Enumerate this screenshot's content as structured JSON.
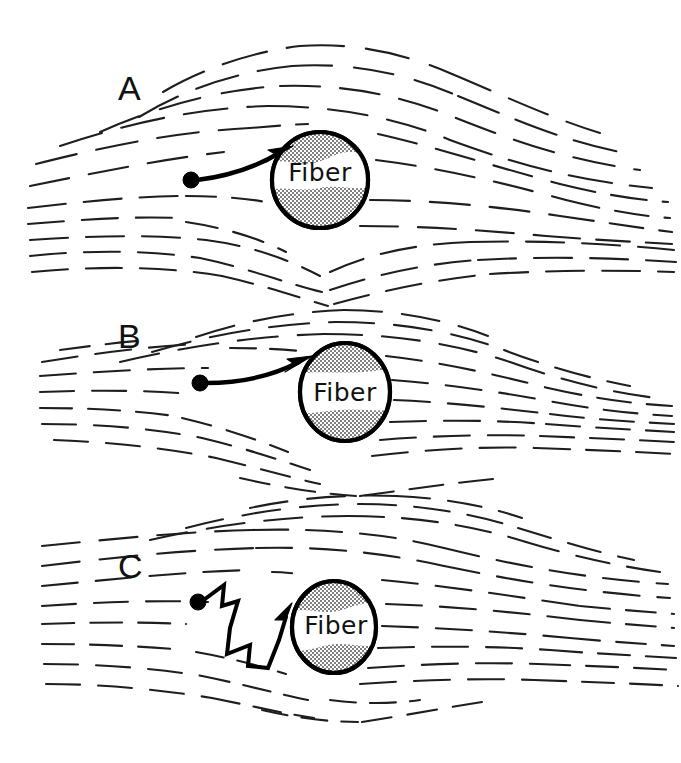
{
  "figure": {
    "background_color": "#ffffff",
    "line_color": "#1e1e1e",
    "fiber_fill_color": "#9a9a9a",
    "fiber_band_color": "#ffffff",
    "width": 681,
    "height": 763
  },
  "panels": [
    {
      "id": "A",
      "label": "A",
      "label_x": 118,
      "label_y": 100,
      "fiber_label": "Fiber",
      "fiber_label_x": 320,
      "fiber_label_y": 181,
      "fiber": {
        "cx": 320,
        "cy": 180,
        "rx": 48,
        "ry": 48
      },
      "particle": {
        "cx": 191,
        "cy": 180,
        "r": 8
      },
      "trajectory_type": "interception-curve",
      "trajectory_path": "M 197 180 C 230 176 258 166 281 152",
      "arrow_tip": {
        "x": 284,
        "y": 150
      }
    },
    {
      "id": "B",
      "label": "B",
      "label_x": 118,
      "label_y": 348,
      "fiber_label": "Fiber",
      "fiber_label_x": 345,
      "fiber_label_y": 393,
      "fiber": {
        "cx": 345,
        "cy": 392,
        "rx": 45,
        "ry": 49
      },
      "particle": {
        "cx": 200,
        "cy": 383,
        "r": 8
      },
      "trajectory_type": "impaction-curve",
      "trajectory_path": "M 206 383 C 242 383 272 376 299 362",
      "arrow_tip": {
        "x": 303,
        "y": 360
      }
    },
    {
      "id": "C",
      "label": "C",
      "label_x": 118,
      "label_y": 578,
      "fiber_label": "Fiber",
      "fiber_label_x": 335,
      "fiber_label_y": 625,
      "fiber": {
        "cx": 334,
        "cy": 627,
        "rx": 42,
        "ry": 46
      },
      "particle": {
        "cx": 198,
        "cy": 602,
        "r": 8
      },
      "trajectory_type": "diffusion-zigzag",
      "trajectory_path": "M 205 599 L 224 585 L 222 606 L 238 601 L 230 628 L 227 654 L 250 645 L 248 666 L 268 668 L 279 640 L 286 617",
      "arrow_tip": {
        "x": 289,
        "y": 610
      }
    }
  ],
  "legend_note": {
    "visible": false
  }
}
